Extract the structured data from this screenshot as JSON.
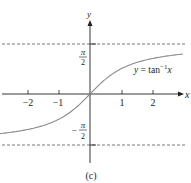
{
  "chart_data": {
    "type": "line",
    "title": "",
    "function_label": "y = tan⁻¹x",
    "function_label_parts": {
      "prefix": "y = tan",
      "sup": "−1",
      "var": "x"
    },
    "xlabel": "x",
    "ylabel": "y",
    "x_ticks": [
      -2,
      -1,
      1,
      2
    ],
    "x_tick_labels": [
      "−2",
      "−1",
      "1",
      "2"
    ],
    "y_tick_labels": {
      "top": "π/2",
      "bottom": "−π/2"
    },
    "asymptotes": [
      1.5708,
      -1.5708
    ],
    "xlim": [
      -2.9,
      3.0
    ],
    "ylim": [
      -2.2,
      2.35
    ],
    "grid": false,
    "legend": "none",
    "series": [
      {
        "name": "arctan",
        "x": [
          -2.9,
          -2.5,
          -2.0,
          -1.5,
          -1.0,
          -0.5,
          0,
          0.5,
          1.0,
          1.5,
          2.0,
          2.5,
          2.9
        ],
        "y": [
          -1.239,
          -1.19,
          -1.107,
          -0.983,
          -0.785,
          -0.464,
          0,
          0.464,
          0.785,
          0.983,
          1.107,
          1.19,
          1.239
        ]
      }
    ],
    "caption": "(c)",
    "colors": {
      "axis": "#231f20",
      "curve": "#8a8a8a",
      "asymptote": "#555555"
    }
  },
  "caption": "(c)",
  "labels": {
    "x_axis": "x",
    "y_axis": "y",
    "pi": "π",
    "two": "2",
    "minus": "−",
    "tick_m2": "−2",
    "tick_m1": "−1",
    "tick_1": "1",
    "tick_2": "2",
    "fn_prefix": "y = tan",
    "fn_sup": "−1",
    "fn_var": "x"
  }
}
